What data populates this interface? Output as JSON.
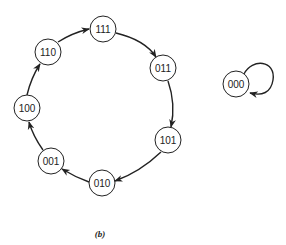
{
  "diagram": {
    "type": "state-transition",
    "caption": "(b)",
    "nodes": [
      {
        "id": "111",
        "label": "111",
        "x": 103,
        "y": 29
      },
      {
        "id": "011",
        "label": "011",
        "x": 163,
        "y": 68
      },
      {
        "id": "101",
        "label": "101",
        "x": 168,
        "y": 140
      },
      {
        "id": "010",
        "label": "010",
        "x": 102,
        "y": 183
      },
      {
        "id": "001",
        "label": "001",
        "x": 51,
        "y": 161
      },
      {
        "id": "100",
        "label": "100",
        "x": 27,
        "y": 108
      },
      {
        "id": "110",
        "label": "110",
        "x": 48,
        "y": 52
      },
      {
        "id": "000",
        "label": "000",
        "x": 236,
        "y": 84
      }
    ],
    "edges": [
      {
        "from": "111",
        "to": "011"
      },
      {
        "from": "011",
        "to": "101"
      },
      {
        "from": "101",
        "to": "010"
      },
      {
        "from": "010",
        "to": "001"
      },
      {
        "from": "001",
        "to": "100"
      },
      {
        "from": "100",
        "to": "110"
      },
      {
        "from": "110",
        "to": "111"
      },
      {
        "from": "000",
        "to": "000"
      }
    ]
  }
}
